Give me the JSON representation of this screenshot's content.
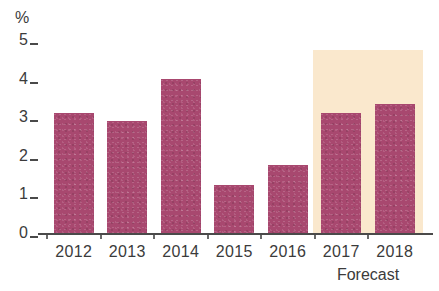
{
  "chart_data": {
    "type": "bar",
    "title": "",
    "subtitle": "",
    "xlabel": "",
    "ylabel": "%",
    "unit_label": "%",
    "categories": [
      "2012",
      "2013",
      "2014",
      "2015",
      "2016",
      "2017",
      "2018"
    ],
    "values": [
      3.1,
      2.9,
      4.0,
      1.25,
      1.75,
      3.1,
      3.35
    ],
    "series": [
      {
        "name": "Annual rate",
        "values": [
          3.1,
          2.9,
          4.0,
          1.25,
          1.75,
          3.1,
          3.35
        ]
      }
    ],
    "ylim": [
      0,
      5
    ],
    "y_ticks": [
      0,
      1,
      2,
      3,
      4,
      5
    ],
    "y_tick_labels": [
      "0",
      "1",
      "2",
      "3",
      "4",
      "5"
    ],
    "grid": false,
    "legend": false,
    "legend_position": "none",
    "annotations": [
      {
        "text": "Forecast",
        "applies_to": [
          "2017",
          "2018"
        ],
        "type": "shaded-region-caption"
      }
    ],
    "forecast_region": {
      "label": "Forecast",
      "start_category": "2017",
      "end_category": "2018",
      "top_value": 4.75
    },
    "colors": {
      "bar": "#a8486f",
      "forecast_band": "#fae8cd",
      "axis": "#4a4a4a",
      "text": "#3b3b3b",
      "background": "#ffffff"
    }
  }
}
